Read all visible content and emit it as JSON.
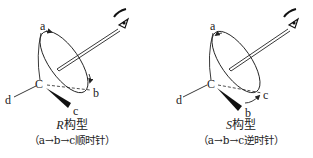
{
  "diagrams": [
    {
      "id": "R",
      "labels": {
        "a": "a",
        "b": "b",
        "c": "c",
        "d": "d",
        "center": "C"
      },
      "title_letter": "R",
      "title_suffix": "构型",
      "subtitle": "（a→b→c顺时针）"
    },
    {
      "id": "S",
      "labels": {
        "a": "a",
        "b": "b",
        "c": "c",
        "d": "d",
        "center": "C"
      },
      "title_letter": "S",
      "title_suffix": "构型",
      "subtitle": "（a→b→c逆时针）"
    }
  ],
  "icons": {
    "viewer": "eye-icon",
    "rotation": "arrow-icon"
  },
  "colors": {
    "stroke": "#222222",
    "background": "#ffffff"
  }
}
